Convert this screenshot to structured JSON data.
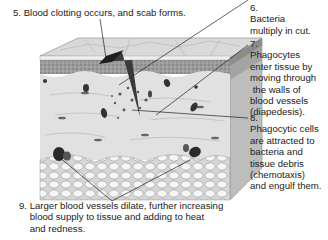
{
  "diagram": {
    "colors": {
      "epidermis_top": "#d8d8d8",
      "epidermis_band": "#a0a0a0",
      "dermis": "#e2e2e2",
      "fat_cells": "#f2f2f2",
      "side_face": "#b8b8b8",
      "wound": "#3a3a3a",
      "leader_line": "#222222"
    },
    "labels": [
      {
        "id": "5",
        "number": "5.",
        "text": "Blood clotting occurs, and scab forms.",
        "lines": [
          "5. Blood clotting occurs, and scab forms."
        ]
      },
      {
        "id": "6",
        "number": "6.",
        "text": "Bacteria multiply in cut.",
        "lines": [
          "6.",
          "Bacteria",
          "multiply in cut."
        ]
      },
      {
        "id": "7",
        "number": "7.",
        "text": "Phagocytes enter tissue by moving through the walls of blood vessels (diapedesis).",
        "lines": [
          "7.",
          "Phagocytes",
          "enter tissue by",
          "moving through",
          " the walls of",
          "blood vessels",
          "(diapedesis)."
        ]
      },
      {
        "id": "8",
        "number": "8.",
        "text": "Phagocytic cells are attracted to bacteria and tissue debris (chemotaxis) and engulf them.",
        "lines": [
          "8.",
          "Phagocytic cells",
          "are attracted to",
          "bacteria and",
          "tissue debris",
          "(chemotaxis)",
          "and engulf them."
        ]
      },
      {
        "id": "9",
        "number": "9.",
        "text": "Larger blood vessels dilate, further increasing blood supply to tissue and adding to heat and redness.",
        "lines": [
          "9. Larger blood vessels dilate, further increasing",
          "    blood supply to tissue and adding to heat",
          "    and redness."
        ]
      }
    ]
  }
}
